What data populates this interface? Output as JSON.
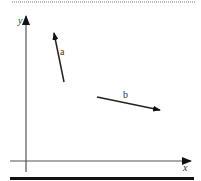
{
  "diagram": {
    "type": "vector-diagram",
    "axes": {
      "x_label": "x",
      "y_label": "y"
    },
    "vectors": [
      {
        "label": "a",
        "tail": [
          64,
          82
        ],
        "tip": [
          54,
          33
        ]
      },
      {
        "label": "b",
        "tail": [
          97,
          97
        ],
        "tip": [
          160,
          110
        ]
      }
    ]
  }
}
